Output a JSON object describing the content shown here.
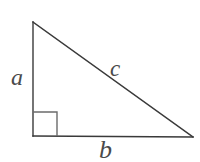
{
  "figure": {
    "name": "right-triangle-diagram",
    "background_color": "#ffffff",
    "stroke_color": "#3a3a3a",
    "label_color": "#4a4a4a",
    "stroke_width": 1.4,
    "width": 200,
    "height": 162
  },
  "geometry": {
    "vertices": {
      "apex": {
        "name": "top-vertex",
        "x": 33,
        "y": 22
      },
      "right_angle": {
        "name": "bottom-left-vertex",
        "x": 33,
        "y": 136
      },
      "base_end": {
        "name": "bottom-right-vertex",
        "x": 193,
        "y": 137
      }
    },
    "right_angle_marker": {
      "name": "right-angle-square",
      "x": 33,
      "y": 112,
      "size": 24
    },
    "polygon_points": "33,22 33,136 193,137"
  },
  "labels": {
    "a": {
      "text": "a",
      "meaning": "vertical-leg",
      "x": 11,
      "y": 65,
      "font_size": 24
    },
    "c": {
      "text": "c",
      "meaning": "hypotenuse",
      "x": 110,
      "y": 57,
      "font_size": 23
    },
    "b": {
      "text": "b",
      "meaning": "horizontal-leg",
      "x": 99,
      "y": 137,
      "font_size": 26
    }
  }
}
